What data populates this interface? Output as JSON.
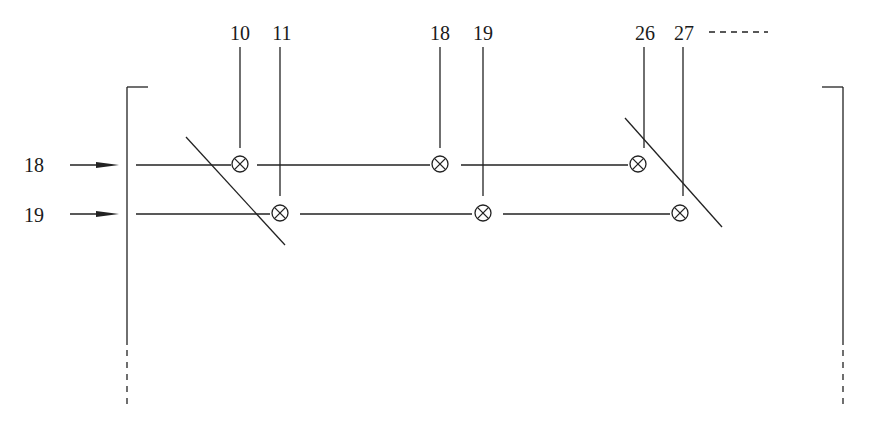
{
  "diagram": {
    "type": "matrix-switch-crosspoint",
    "column_labels": [
      "10",
      "11",
      "18",
      "19",
      "26",
      "27"
    ],
    "column_continuation": "-----",
    "row_labels": [
      "18",
      "19"
    ],
    "crosspoints": [
      {
        "row": "18",
        "column": "10"
      },
      {
        "row": "19",
        "column": "11"
      },
      {
        "row": "18",
        "column": "18"
      },
      {
        "row": "19",
        "column": "19"
      },
      {
        "row": "18",
        "column": "26"
      },
      {
        "row": "19",
        "column": "27"
      }
    ],
    "crosspoint_symbol": "⊗",
    "colors": {
      "line": "#222222",
      "background": "#ffffff"
    }
  }
}
